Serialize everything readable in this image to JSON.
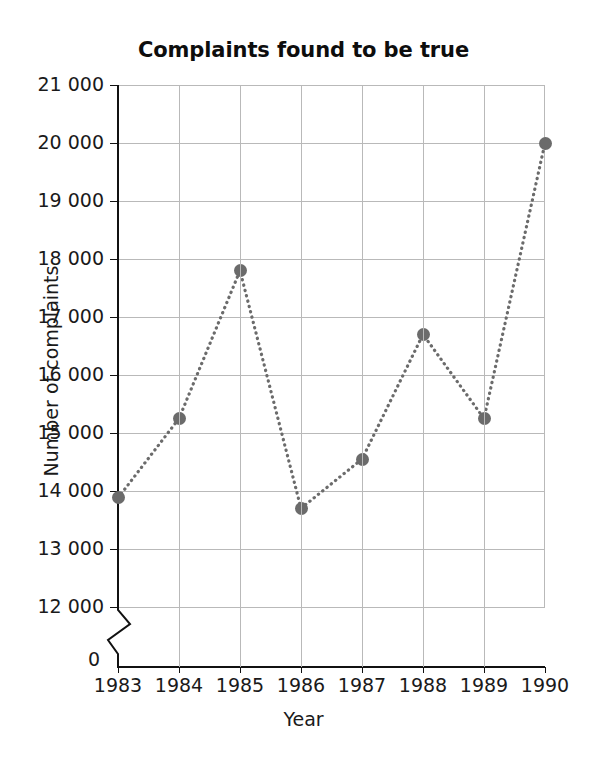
{
  "chart_data": {
    "type": "line",
    "title": "Complaints found to be true",
    "xlabel": "Year",
    "ylabel": "Number of complaints",
    "categories": [
      "1983",
      "1984",
      "1985",
      "1986",
      "1987",
      "1988",
      "1989",
      "1990"
    ],
    "values": [
      13880,
      15250,
      17800,
      13700,
      14550,
      16700,
      15250,
      20000
    ],
    "ylim": [
      12000,
      21000
    ],
    "y_ticks": [
      12000,
      13000,
      14000,
      15000,
      16000,
      17000,
      18000,
      19000,
      20000,
      21000
    ],
    "y_tick_labels": [
      "12 000",
      "13 000",
      "14 000",
      "15 000",
      "16 000",
      "17 000",
      "18 000",
      "19 000",
      "20 000",
      "21 000"
    ],
    "origin_label": "0",
    "axis_break": true,
    "grid": true,
    "legend": "none",
    "marker_style": "filled-circle",
    "line_style": "dotted",
    "colors": {
      "marker": "#6b6b6b",
      "line": "#6b6b6b",
      "grid": "#b9b9b9",
      "axis": "#111111",
      "text": "#1a1a1a"
    }
  }
}
